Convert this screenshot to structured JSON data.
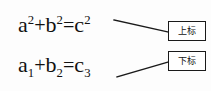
{
  "figure": {
    "background_color": "#fdfdfd",
    "ink_color": "#111111",
    "equations": [
      {
        "id": "superscript-example",
        "plain": "a2+b2=c2",
        "base_terms": [
          "a",
          "b",
          "c"
        ],
        "script_kind": "superscript",
        "parts": {
          "t1_base": "a",
          "t1_script": "2",
          "op1": "+",
          "t2_base": "b",
          "t2_script": "2",
          "rel": "=",
          "t3_base": "c",
          "t3_script": "2"
        }
      },
      {
        "id": "subscript-example",
        "plain": "a1+b2=c3",
        "base_terms": [
          "a",
          "b",
          "c"
        ],
        "script_kind": "subscript",
        "parts": {
          "t1_base": "a",
          "t1_script": "1",
          "op1": "+",
          "t2_base": "b",
          "t2_script": "2",
          "rel": "=",
          "t3_base": "c",
          "t3_script": "3"
        }
      }
    ],
    "callouts": [
      {
        "id": "superscript-callout",
        "label": "上标",
        "points_to": "superscript-example",
        "border_color": "#1a1a1a",
        "fill_color": "#ffffff"
      },
      {
        "id": "subscript-callout",
        "label": "下标",
        "points_to": "subscript-example",
        "border_color": "#1a1a1a",
        "fill_color": "#ffffff"
      }
    ],
    "connectors": [
      {
        "id": "superscript-connector",
        "from": [
          114,
          20
        ],
        "to": [
          168,
          32
        ],
        "color": "#1a1a1a"
      },
      {
        "id": "subscript-connector",
        "from": [
          117,
          77
        ],
        "to": [
          168,
          62
        ],
        "color": "#1a1a1a"
      }
    ]
  }
}
